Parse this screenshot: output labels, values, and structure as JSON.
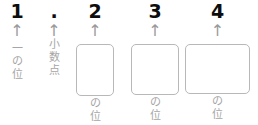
{
  "diagram": {
    "number_shown": "1.234",
    "arrow_glyph": "↑",
    "colors": {
      "digit": "#0d0d0d",
      "label": "#a6a6a6",
      "arrow": "#9a9a9a",
      "box_border": "#b8b8b8",
      "background": "#ffffff"
    },
    "columns": [
      {
        "id": "ones",
        "digit": "1",
        "arrow": "↑",
        "label_chars": [
          "一",
          "の",
          "位"
        ],
        "label_text": "一の位",
        "has_box": false
      },
      {
        "id": "decimal-point",
        "digit": ".",
        "arrow": "↑",
        "label_chars": [
          "小",
          "数",
          "点"
        ],
        "label_text": "小数点",
        "has_box": false
      },
      {
        "id": "tenths",
        "digit": "2",
        "arrow": "↑",
        "label_chars": [
          "の",
          "位"
        ],
        "label_text": "の位",
        "has_box": true,
        "box_value": ""
      },
      {
        "id": "hundredths",
        "digit": "3",
        "arrow": "↑",
        "label_chars": [
          "の",
          "位"
        ],
        "label_text": "の位",
        "has_box": true,
        "box_value": ""
      },
      {
        "id": "thousandths",
        "digit": "4",
        "arrow": "↑",
        "label_chars": [
          "の",
          "位"
        ],
        "label_text": "の位",
        "has_box": true,
        "box_value": ""
      }
    ]
  }
}
